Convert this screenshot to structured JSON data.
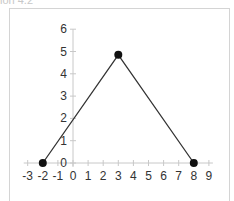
{
  "caption": "ion 4.2",
  "chart_data": {
    "type": "line",
    "title": "",
    "xlabel": "",
    "ylabel": "",
    "xlim": [
      -3,
      9
    ],
    "ylim": [
      0,
      6
    ],
    "x_ticks": [
      -3,
      -2,
      -1,
      0,
      1,
      2,
      3,
      4,
      5,
      6,
      7,
      8,
      9
    ],
    "y_ticks": [
      0,
      1,
      2,
      3,
      4,
      5,
      6
    ],
    "grid": false,
    "legend": "none",
    "series": [
      {
        "name": "series-1",
        "x": [
          -2,
          3,
          8
        ],
        "y": [
          0,
          4.85,
          0
        ],
        "color": "#333333",
        "marker": "circle",
        "marker_color": "#111111"
      }
    ],
    "axis_color": "#c8c8c8"
  }
}
